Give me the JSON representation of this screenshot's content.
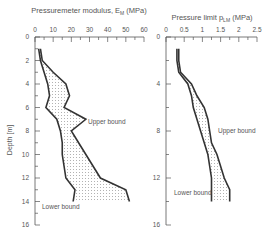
{
  "chart_data": [
    {
      "type": "line",
      "title": "Pressuremeter modulus, E_M (MPa)",
      "xlabel": "Pressuremeter modulus, E_M (MPa)",
      "ylabel": "Depth [m]",
      "xlim": [
        0,
        60
      ],
      "ylim": [
        0,
        16
      ],
      "x_ticks": [
        "0",
        "10",
        "20",
        "30",
        "40",
        "50",
        "60"
      ],
      "y_ticks": [
        "0",
        "2",
        "4",
        "6",
        "8",
        "10",
        "12",
        "14",
        "16"
      ],
      "depth": [
        1,
        2,
        3,
        4,
        5,
        6,
        7,
        8,
        9,
        10,
        11,
        12,
        13,
        14
      ],
      "series": [
        {
          "name": "Upper bound",
          "values": [
            3,
            4,
            10,
            17,
            19,
            16,
            28,
            20,
            24,
            28,
            32,
            36,
            50,
            52
          ]
        },
        {
          "name": "Lower bound",
          "values": [
            2,
            3,
            5,
            7,
            8,
            6,
            12,
            14,
            15,
            15,
            16,
            17,
            22,
            21
          ]
        }
      ],
      "annotations": [
        "Upper bound",
        "Lower bound"
      ],
      "fill_between": true,
      "grid": false
    },
    {
      "type": "line",
      "title": "Pressure limit p_LM (MPa)",
      "xlabel": "Pressure limit p_LM (MPa)",
      "ylabel": "",
      "xlim": [
        0,
        2.5
      ],
      "ylim": [
        0,
        16
      ],
      "x_ticks": [
        "0",
        "0.5",
        "1",
        "1.5",
        "2",
        "2.5"
      ],
      "y_ticks": [
        "0",
        "4",
        "8",
        "12",
        "16"
      ],
      "depth": [
        1,
        2,
        3,
        4,
        5,
        6,
        7,
        8,
        9,
        10,
        11,
        12,
        13,
        14
      ],
      "series": [
        {
          "name": "Upper bound",
          "values": [
            0.35,
            0.35,
            0.4,
            0.7,
            0.85,
            1.05,
            1.15,
            1.2,
            1.25,
            1.4,
            1.5,
            1.6,
            1.75,
            1.75
          ]
        },
        {
          "name": "Lower bound",
          "values": [
            0.3,
            0.3,
            0.35,
            0.6,
            0.7,
            0.75,
            0.85,
            0.95,
            1.05,
            1.15,
            1.2,
            1.25,
            1.25,
            1.25
          ]
        }
      ],
      "annotations": [
        "Upper bound",
        "Lower bound"
      ],
      "fill_between": true,
      "grid": false
    }
  ],
  "labels": {
    "left_title": "Pressuremeter modulus, E",
    "left_sub": "M",
    "left_unit": " (MPa)",
    "right_title": "Pressure limit p",
    "right_sub": "LM",
    "right_unit": " (MPa)",
    "depth_label": "Depth [m]",
    "upper": "Upper bound",
    "lower": "Lower bound"
  },
  "colors": {
    "line": "#333333",
    "text": "#555555",
    "axis": "#555555",
    "fill_dot": "#999999"
  }
}
